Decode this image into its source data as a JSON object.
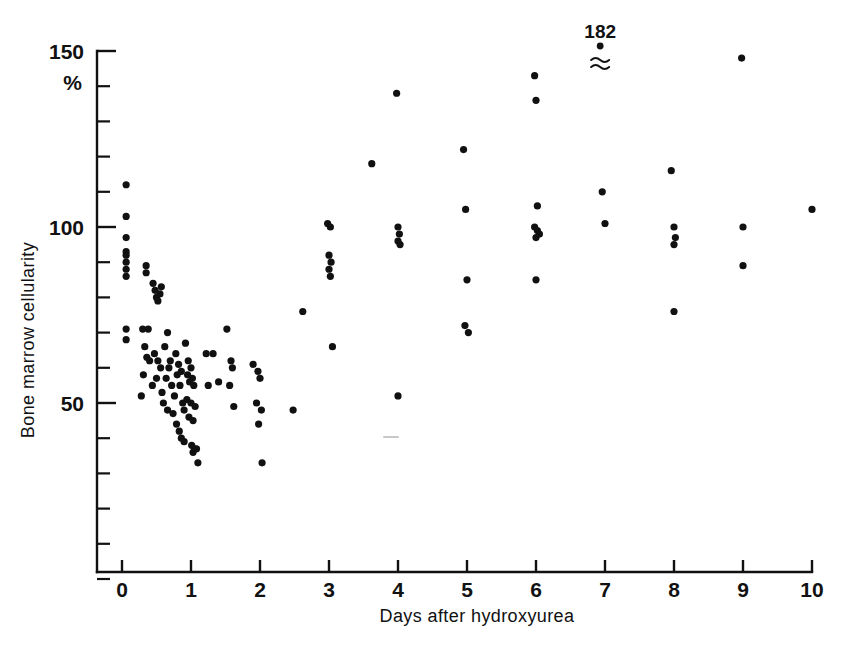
{
  "figure": {
    "background_color": "#ffffff",
    "ink_color": "#111111"
  },
  "chart_data": {
    "type": "scatter",
    "title": "",
    "xlabel": "Days after hydroxyurea",
    "ylabel": "Bone marrow cellularity",
    "yunit": "%",
    "xlim": [
      0,
      10
    ],
    "ylim": [
      0,
      150
    ],
    "grid": false,
    "legend": null,
    "x_ticks": [
      0,
      1,
      2,
      3,
      4,
      5,
      6,
      7,
      8,
      9,
      10
    ],
    "x_tick_labels": [
      "0",
      "1",
      "2",
      "3",
      "4",
      "5",
      "6",
      "7",
      "8",
      "9",
      "10"
    ],
    "y_ticks_major": [
      50,
      100,
      150
    ],
    "y_tick_labels_major": [
      "50",
      "100",
      "150"
    ],
    "y_ticks_minor": [
      0,
      10,
      20,
      30,
      40,
      60,
      70,
      80,
      90,
      110,
      120,
      130,
      140
    ],
    "annotations": [
      {
        "text": "182",
        "x": 6.93,
        "y": 163,
        "point_x": 6.93,
        "point_y": 153,
        "break_symbol": "approximately-equal",
        "note": "off-scale value plotted above axis with break symbol"
      }
    ],
    "points": [
      {
        "x": 0.06,
        "y": 112
      },
      {
        "x": 0.06,
        "y": 103
      },
      {
        "x": 0.06,
        "y": 97
      },
      {
        "x": 0.06,
        "y": 93
      },
      {
        "x": 0.06,
        "y": 92
      },
      {
        "x": 0.06,
        "y": 90
      },
      {
        "x": 0.06,
        "y": 88
      },
      {
        "x": 0.06,
        "y": 86
      },
      {
        "x": 0.06,
        "y": 71
      },
      {
        "x": 0.06,
        "y": 68
      },
      {
        "x": 0.35,
        "y": 89
      },
      {
        "x": 0.35,
        "y": 87
      },
      {
        "x": 0.3,
        "y": 71
      },
      {
        "x": 0.38,
        "y": 71
      },
      {
        "x": 0.33,
        "y": 66
      },
      {
        "x": 0.36,
        "y": 63
      },
      {
        "x": 0.4,
        "y": 62
      },
      {
        "x": 0.31,
        "y": 58
      },
      {
        "x": 0.28,
        "y": 52
      },
      {
        "x": 0.45,
        "y": 84
      },
      {
        "x": 0.48,
        "y": 82
      },
      {
        "x": 0.5,
        "y": 80
      },
      {
        "x": 0.52,
        "y": 79
      },
      {
        "x": 0.55,
        "y": 81
      },
      {
        "x": 0.57,
        "y": 83
      },
      {
        "x": 0.47,
        "y": 64
      },
      {
        "x": 0.52,
        "y": 62
      },
      {
        "x": 0.56,
        "y": 60
      },
      {
        "x": 0.5,
        "y": 57
      },
      {
        "x": 0.44,
        "y": 55
      },
      {
        "x": 0.58,
        "y": 53
      },
      {
        "x": 0.62,
        "y": 66
      },
      {
        "x": 0.66,
        "y": 70
      },
      {
        "x": 0.7,
        "y": 62
      },
      {
        "x": 0.68,
        "y": 60
      },
      {
        "x": 0.64,
        "y": 57
      },
      {
        "x": 0.72,
        "y": 55
      },
      {
        "x": 0.6,
        "y": 50
      },
      {
        "x": 0.66,
        "y": 48
      },
      {
        "x": 0.74,
        "y": 47
      },
      {
        "x": 0.78,
        "y": 64
      },
      {
        "x": 0.82,
        "y": 61
      },
      {
        "x": 0.8,
        "y": 58
      },
      {
        "x": 0.86,
        "y": 59
      },
      {
        "x": 0.84,
        "y": 55
      },
      {
        "x": 0.76,
        "y": 52
      },
      {
        "x": 0.88,
        "y": 50
      },
      {
        "x": 0.9,
        "y": 48
      },
      {
        "x": 0.79,
        "y": 44
      },
      {
        "x": 0.83,
        "y": 42
      },
      {
        "x": 0.92,
        "y": 67
      },
      {
        "x": 0.96,
        "y": 62
      },
      {
        "x": 1.0,
        "y": 60
      },
      {
        "x": 0.95,
        "y": 58
      },
      {
        "x": 1.02,
        "y": 57
      },
      {
        "x": 0.98,
        "y": 56
      },
      {
        "x": 1.04,
        "y": 55
      },
      {
        "x": 0.94,
        "y": 51
      },
      {
        "x": 1.0,
        "y": 50
      },
      {
        "x": 1.06,
        "y": 49
      },
      {
        "x": 0.97,
        "y": 46
      },
      {
        "x": 1.03,
        "y": 45
      },
      {
        "x": 1.01,
        "y": 38
      },
      {
        "x": 1.05,
        "y": 37
      },
      {
        "x": 1.03,
        "y": 36
      },
      {
        "x": 1.08,
        "y": 37
      },
      {
        "x": 1.1,
        "y": 33
      },
      {
        "x": 0.86,
        "y": 40
      },
      {
        "x": 0.9,
        "y": 39
      },
      {
        "x": 1.22,
        "y": 64
      },
      {
        "x": 1.32,
        "y": 64
      },
      {
        "x": 1.25,
        "y": 55
      },
      {
        "x": 1.4,
        "y": 56
      },
      {
        "x": 1.52,
        "y": 71
      },
      {
        "x": 1.58,
        "y": 62
      },
      {
        "x": 1.6,
        "y": 60
      },
      {
        "x": 1.56,
        "y": 55
      },
      {
        "x": 1.62,
        "y": 49
      },
      {
        "x": 1.9,
        "y": 61
      },
      {
        "x": 1.97,
        "y": 59
      },
      {
        "x": 2.0,
        "y": 57
      },
      {
        "x": 1.95,
        "y": 50
      },
      {
        "x": 2.02,
        "y": 48
      },
      {
        "x": 1.98,
        "y": 44
      },
      {
        "x": 2.03,
        "y": 33
      },
      {
        "x": 2.48,
        "y": 48
      },
      {
        "x": 2.62,
        "y": 76
      },
      {
        "x": 2.98,
        "y": 101
      },
      {
        "x": 3.02,
        "y": 100
      },
      {
        "x": 3.0,
        "y": 92
      },
      {
        "x": 3.03,
        "y": 90
      },
      {
        "x": 3.0,
        "y": 88
      },
      {
        "x": 3.02,
        "y": 86
      },
      {
        "x": 3.05,
        "y": 66
      },
      {
        "x": 3.62,
        "y": 118
      },
      {
        "x": 3.98,
        "y": 138
      },
      {
        "x": 4.0,
        "y": 100
      },
      {
        "x": 4.02,
        "y": 98
      },
      {
        "x": 4.0,
        "y": 96
      },
      {
        "x": 4.03,
        "y": 95
      },
      {
        "x": 4.0,
        "y": 52
      },
      {
        "x": 4.95,
        "y": 122
      },
      {
        "x": 4.98,
        "y": 105
      },
      {
        "x": 5.0,
        "y": 85
      },
      {
        "x": 4.97,
        "y": 72
      },
      {
        "x": 5.02,
        "y": 70
      },
      {
        "x": 5.98,
        "y": 143
      },
      {
        "x": 6.0,
        "y": 136
      },
      {
        "x": 6.02,
        "y": 106
      },
      {
        "x": 5.98,
        "y": 100
      },
      {
        "x": 6.02,
        "y": 99
      },
      {
        "x": 6.05,
        "y": 98
      },
      {
        "x": 6.0,
        "y": 97
      },
      {
        "x": 6.0,
        "y": 85
      },
      {
        "x": 6.96,
        "y": 110
      },
      {
        "x": 7.0,
        "y": 101
      },
      {
        "x": 7.96,
        "y": 116
      },
      {
        "x": 8.0,
        "y": 100
      },
      {
        "x": 8.02,
        "y": 97
      },
      {
        "x": 8.0,
        "y": 95
      },
      {
        "x": 8.0,
        "y": 76
      },
      {
        "x": 8.98,
        "y": 148
      },
      {
        "x": 9.0,
        "y": 100
      },
      {
        "x": 9.0,
        "y": 89
      },
      {
        "x": 10.0,
        "y": 105
      }
    ]
  }
}
